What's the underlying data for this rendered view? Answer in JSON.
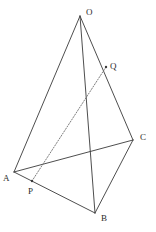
{
  "figure": {
    "width": 156,
    "height": 232,
    "background_color": "#ffffff",
    "stroke_color": "#3a3a3a",
    "dashed_stroke_color": "#6e6e6e",
    "label_color": "#2b2b2b",
    "stroke_width": 0.9,
    "dash_pattern": "1.2 1.6"
  },
  "points": {
    "O": {
      "label": "O",
      "x": 80,
      "y": 16,
      "label_x": 86,
      "label_y": 8,
      "marked": false
    },
    "A": {
      "label": "A",
      "x": 14,
      "y": 172,
      "label_x": 3,
      "label_y": 174,
      "marked": false
    },
    "B": {
      "label": "B",
      "x": 95,
      "y": 213,
      "label_x": 101,
      "label_y": 214,
      "marked": false
    },
    "C": {
      "label": "C",
      "x": 133,
      "y": 140,
      "label_x": 140,
      "label_y": 133,
      "marked": false
    },
    "P": {
      "label": "P",
      "x": 32,
      "y": 181,
      "label_x": 28,
      "label_y": 187,
      "marked": true
    },
    "Q": {
      "label": "Q",
      "x": 106,
      "y": 67,
      "label_x": 110,
      "label_y": 62,
      "marked": true
    }
  },
  "edges": [
    {
      "name": "edge-OA",
      "from": "O",
      "to": "A",
      "style": "solid"
    },
    {
      "name": "edge-OB",
      "from": "O",
      "to": "B",
      "style": "solid"
    },
    {
      "name": "edge-OC",
      "from": "O",
      "to": "C",
      "style": "solid"
    },
    {
      "name": "edge-AB",
      "from": "A",
      "to": "B",
      "style": "solid"
    },
    {
      "name": "edge-AC",
      "from": "A",
      "to": "C",
      "style": "solid"
    },
    {
      "name": "edge-BC",
      "from": "B",
      "to": "C",
      "style": "solid"
    },
    {
      "name": "segment-PQ",
      "from": "P",
      "to": "Q",
      "style": "dashed"
    }
  ]
}
